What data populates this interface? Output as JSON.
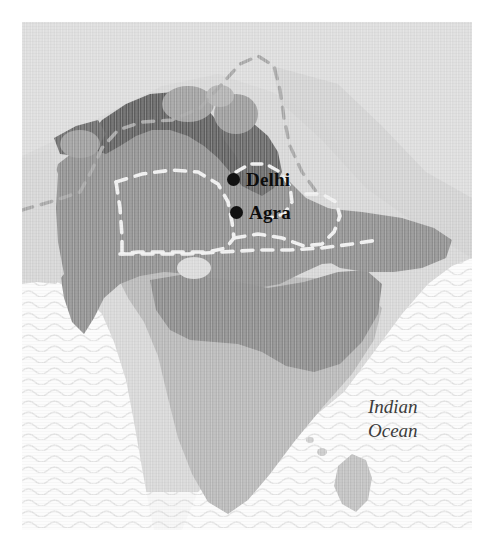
{
  "figure": {
    "kind": "historical-map",
    "region_title": "Indian subcontinent",
    "background_color": "#ffffff",
    "plate_background_color": "#ececec"
  },
  "map": {
    "ocean_label": "Indian\nOcean",
    "water": {
      "label": "Indian Ocean",
      "fill_color": "#fbfbfb",
      "wave_line_color": "#e3e3e3"
    },
    "regions": [
      {
        "name": "core-empire",
        "role": "main territory",
        "fill_color": "#8c8c8c",
        "description": "large medium-grey territory covering northern and central subcontinent"
      },
      {
        "name": "northern-highland-band",
        "role": "darkest band along northern frontier",
        "fill_color": "#5c5c5c",
        "description": "dark grey belt across the north-west and north of the empire"
      },
      {
        "name": "peninsular-south",
        "role": "lighter southern landmass",
        "fill_color": "#b4b4b4",
        "description": "lighter grey peninsula south of the empire"
      },
      {
        "name": "outer-land",
        "role": "surrounding land outside empire",
        "fill_color": "#d2d2d2",
        "description": "pale grey land beyond the shaded territories"
      },
      {
        "name": "island-southeast",
        "role": "island off the south-east coast",
        "fill_color": "#bdbdbd",
        "description": "small teardrop island (Sri Lanka position)"
      },
      {
        "name": "inland-lake",
        "role": "pale inland feature",
        "fill_color": "#d8d8d8",
        "description": "small light ellipse inside the central territory"
      }
    ],
    "boundaries": [
      {
        "name": "internal-boundary-dashed-white",
        "style": "dashed",
        "color": "#f2f2f2",
        "description": "white dashed provincial boundary crossing the core empire"
      },
      {
        "name": "northern-boundary-dashed-grey",
        "style": "dashed",
        "color": "#a0a0a0",
        "description": "grey dashed boundary in the pale northern land"
      }
    ],
    "cities": [
      {
        "name": "Delhi",
        "label": "Delhi",
        "x": 212,
        "y": 156,
        "marker": "filled-circle"
      },
      {
        "name": "Agra",
        "label": "Agra",
        "x": 215,
        "y": 189,
        "marker": "filled-circle"
      }
    ]
  },
  "colors": {
    "land_dark": "#5c5c5c",
    "land_core": "#8c8c8c",
    "land_south": "#b4b4b4",
    "land_outer": "#d2d2d2",
    "ocean": "#fbfbfb",
    "label_text": "#0d0d0d",
    "ocean_text": "#3c3c3c"
  }
}
